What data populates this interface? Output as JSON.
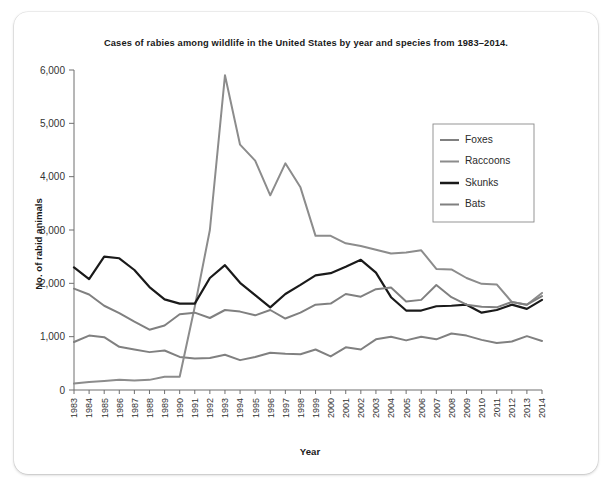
{
  "chart_data": {
    "type": "line",
    "title": "Cases of rabies among wildlife in the United States by year and species from 1983–2014.",
    "xlabel": "Year",
    "ylabel": "No. of rabid animals",
    "ylim": [
      0,
      6000
    ],
    "ytick_labels": [
      "0",
      "1,000",
      "2,000",
      "3,000",
      "4,000",
      "5,000",
      "6,000"
    ],
    "ytick_values": [
      0,
      1000,
      2000,
      3000,
      4000,
      5000,
      6000
    ],
    "grid": false,
    "legend_position": "upper-right",
    "categories": [
      "1983",
      "1984",
      "1985",
      "1986",
      "1987",
      "1988",
      "1989",
      "1990",
      "1991",
      "1992",
      "1993",
      "1994",
      "1995",
      "1996",
      "1997",
      "1998",
      "1999",
      "2000",
      "2001",
      "2002",
      "2003",
      "2004",
      "2005",
      "2006",
      "2007",
      "2008",
      "2009",
      "2010",
      "2011",
      "2012",
      "2013",
      "2014"
    ],
    "x": [
      1983,
      1984,
      1985,
      1986,
      1987,
      1988,
      1989,
      1990,
      1991,
      1992,
      1993,
      1994,
      1995,
      1996,
      1997,
      1998,
      1999,
      2000,
      2001,
      2002,
      2003,
      2004,
      2005,
      2006,
      2007,
      2008,
      2009,
      2010,
      2011,
      2012,
      2013,
      2014
    ],
    "series": [
      {
        "name": "Foxes",
        "color": "#808080",
        "width": 2.0,
        "values": [
          900,
          1020,
          990,
          810,
          760,
          710,
          740,
          620,
          590,
          600,
          660,
          560,
          620,
          700,
          680,
          670,
          760,
          630,
          800,
          760,
          950,
          1000,
          930,
          1000,
          950,
          1060,
          1020,
          940,
          880,
          910,
          1010,
          920
        ]
      },
      {
        "name": "Raccoons",
        "color": "#8c8c8c",
        "width": 2.0,
        "values": [
          120,
          150,
          170,
          190,
          180,
          190,
          250,
          250,
          1560,
          3000,
          5900,
          4600,
          4300,
          3650,
          4250,
          3800,
          2890,
          2890,
          2750,
          2700,
          2630,
          2560,
          2580,
          2620,
          2270,
          2260,
          2100,
          1990,
          1980,
          1650,
          1600,
          1820
        ]
      },
      {
        "name": "Skunks",
        "color": "#1a1a1a",
        "width": 2.2,
        "values": [
          2300,
          2080,
          2500,
          2470,
          2250,
          1930,
          1700,
          1620,
          1620,
          2100,
          2340,
          2010,
          1780,
          1550,
          1800,
          1970,
          2150,
          2190,
          2310,
          2440,
          2200,
          1740,
          1490,
          1490,
          1570,
          1580,
          1600,
          1450,
          1500,
          1600,
          1520,
          1690
        ]
      },
      {
        "name": "Bats",
        "color": "#808080",
        "width": 2.0,
        "values": [
          1900,
          1790,
          1580,
          1440,
          1280,
          1130,
          1210,
          1420,
          1450,
          1350,
          1500,
          1470,
          1400,
          1500,
          1340,
          1450,
          1600,
          1620,
          1800,
          1750,
          1890,
          1920,
          1660,
          1690,
          1970,
          1740,
          1600,
          1560,
          1550,
          1650,
          1600,
          1760
        ]
      }
    ],
    "legend_entries": [
      {
        "label": "Foxes",
        "color": "#808080",
        "width": 2.0
      },
      {
        "label": "Raccoons",
        "color": "#8c8c8c",
        "width": 2.0
      },
      {
        "label": "Skunks",
        "color": "#1a1a1a",
        "width": 2.6
      },
      {
        "label": "Bats",
        "color": "#808080",
        "width": 2.0
      }
    ]
  }
}
